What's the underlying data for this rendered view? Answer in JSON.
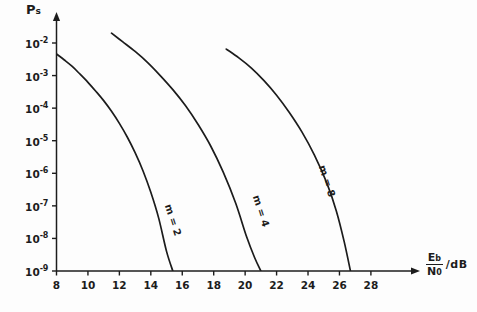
{
  "chart_data": {
    "type": "line",
    "title": "",
    "subtitle": "",
    "ylabel": "Ps",
    "ylabel_main": "P",
    "ylabel_sub": "s",
    "xlabel": "Eb/N0 /dB",
    "xlabel_num": "E",
    "xlabel_num_sub": "b",
    "xlabel_den": "N",
    "xlabel_den_sub": "0",
    "xlabel_units": "/dB",
    "grid": false,
    "legend_position": "inline-curve-labels",
    "yscale": "log",
    "xlim": [
      7,
      29.5
    ],
    "ylim": [
      1e-09,
      0.01
    ],
    "ytick_labels": [
      "10-2",
      "10-3",
      "10-4",
      "10-5",
      "10-6",
      "10-7",
      "10-8",
      "10-9"
    ],
    "ytick_mantissa": "10",
    "ytick_exponents": [
      "-2",
      "-3",
      "-4",
      "-5",
      "-6",
      "-7",
      "-8",
      "-9"
    ],
    "ytick_values": [
      0.01,
      0.001,
      0.0001,
      1e-05,
      1e-06,
      1e-07,
      1e-08,
      1e-09
    ],
    "xtick_labels": [
      "8",
      "10",
      "12",
      "14",
      "16",
      "18",
      "20",
      "22",
      "24",
      "26",
      "28"
    ],
    "xtick_values": [
      8,
      10,
      12,
      14,
      16,
      18,
      20,
      22,
      24,
      26,
      28
    ],
    "axis_color": "#1c1c1c",
    "curve_color": "#1c1c1c",
    "background_color": "#fdfdfd",
    "series": [
      {
        "name": "m = 2",
        "label_main": "m = ",
        "label_value": "2",
        "label_rotation": 72,
        "label_x": 168,
        "label_y": 199,
        "x": [
          7.9,
          8.5,
          9.0,
          9.5,
          10.0,
          10.5,
          11.0,
          11.5,
          12.0,
          12.5,
          13.0,
          13.5,
          14.0,
          14.5,
          15.0,
          15.4
        ],
        "y": [
          0.005,
          0.003,
          0.0019,
          0.0011,
          0.00062,
          0.00033,
          0.00017,
          8e-05,
          3.4e-05,
          1.3e-05,
          4.3e-06,
          1.2e-06,
          2.6e-07,
          4.2e-08,
          4e-09,
          1e-09
        ]
      },
      {
        "name": "m = 4",
        "label_main": "m = ",
        "label_value": "4",
        "label_rotation": 72,
        "label_x": 256,
        "label_y": 190,
        "x": [
          11.5,
          12.2,
          13.0,
          13.8,
          14.6,
          15.4,
          16.2,
          17.0,
          17.8,
          18.6,
          19.4,
          20.1,
          20.6,
          21.0
        ],
        "y": [
          0.02,
          0.011,
          0.0055,
          0.0025,
          0.001,
          0.00037,
          0.00012,
          3.2e-05,
          7e-06,
          1.1e-06,
          1.2e-07,
          1.1e-08,
          2.6e-09,
          1e-09
        ]
      },
      {
        "name": "m = 8",
        "label_main": "m = ",
        "label_value": "8",
        "label_rotation": 72,
        "label_x": 322,
        "label_y": 160,
        "x": [
          18.8,
          19.6,
          20.4,
          21.2,
          22.0,
          22.8,
          23.6,
          24.4,
          25.2,
          25.8,
          26.3,
          26.7
        ],
        "y": [
          0.0065,
          0.0035,
          0.0017,
          0.0007,
          0.00025,
          7.5e-05,
          1.9e-05,
          3.7e-06,
          5e-07,
          7e-08,
          8e-09,
          1e-09
        ]
      }
    ]
  }
}
